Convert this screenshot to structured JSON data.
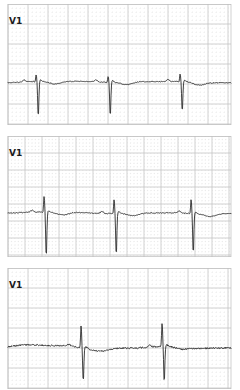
{
  "document": {
    "kind": "ecg-rhythm-strips",
    "strip_count": 3,
    "paper_color": "#ffffff",
    "grid_minor_color": "#d8d8d8",
    "grid_major_color": "#bdbdbd",
    "trace_color": "#2a2a2a"
  },
  "strips": [
    {
      "lead_label": "V1",
      "grid": {
        "minor_px": 4.0,
        "major_px": 20.0,
        "style": "dotted-minor-solid-major",
        "left": 8,
        "right": 231,
        "top": 4,
        "bottom": 125
      },
      "baseline_y": 82,
      "beats": [
        {
          "r_x": 37,
          "q_depth": 0,
          "r_height": 7,
          "s_depth": 36,
          "t_height": 3
        },
        {
          "r_x": 109,
          "q_depth": 0,
          "r_height": 6,
          "s_depth": 34,
          "t_height": 3
        },
        {
          "r_x": 181,
          "q_depth": 0,
          "r_height": 8,
          "s_depth": 30,
          "t_height": 3
        }
      ],
      "morphology": "rS complexes with small R and deep narrow S wave",
      "beat_count": 3
    },
    {
      "lead_label": "V1",
      "grid": {
        "minor_px": 3.4,
        "major_px": 17.0,
        "style": "dotted-minor-solid-major",
        "left": 8,
        "right": 231,
        "top": 136,
        "bottom": 257
      },
      "baseline_y": 213,
      "beats": [
        {
          "r_x": 45,
          "q_depth": 0,
          "r_height": 16,
          "s_depth": 45,
          "t_height": 3
        },
        {
          "r_x": 115,
          "q_depth": 0,
          "r_height": 14,
          "s_depth": 42,
          "t_height": 3
        },
        {
          "r_x": 192,
          "q_depth": 0,
          "r_height": 14,
          "s_depth": 40,
          "t_height": 3
        }
      ],
      "morphology": "RS complexes with tall R and very deep S wave",
      "beat_count": 3
    },
    {
      "lead_label": "V1",
      "grid": {
        "minor_px": 4.0,
        "major_px": 20.0,
        "style": "dotted-minor-solid-major",
        "left": 8,
        "right": 231,
        "top": 268,
        "bottom": 389
      },
      "baseline_y": 347,
      "beats": [
        {
          "r_x": 82,
          "q_depth": 0,
          "r_height": 22,
          "s_depth": 34,
          "t_height": 2
        },
        {
          "r_x": 163,
          "q_depth": 0,
          "r_height": 24,
          "s_depth": 36,
          "t_height": 2
        }
      ],
      "morphology": "RS complexes on a wandering noisy baseline",
      "beat_count": 2
    }
  ],
  "chart_data": {
    "type": "line",
    "title": "",
    "xlabel": "",
    "ylabel": "",
    "grid": true,
    "legend_position": "none",
    "series": [
      {
        "name": "V1 strip 1",
        "x_range_px": [
          8,
          231
        ],
        "baseline_px": 82,
        "r_peaks_px": [
          37,
          109,
          181
        ],
        "s_nadir_px": [
          118,
          116,
          112
        ],
        "r_peak_px": [
          75,
          76,
          74
        ]
      },
      {
        "name": "V1 strip 2",
        "x_range_px": [
          8,
          231
        ],
        "baseline_px": 213,
        "r_peaks_px": [
          45,
          115,
          192
        ],
        "s_nadir_px": [
          258,
          255,
          253
        ],
        "r_peak_px": [
          197,
          199,
          199
        ]
      },
      {
        "name": "V1 strip 3",
        "x_range_px": [
          8,
          231
        ],
        "baseline_px": 347,
        "r_peaks_px": [
          82,
          163
        ],
        "s_nadir_px": [
          381,
          383
        ],
        "r_peak_px": [
          325,
          323
        ]
      }
    ]
  }
}
